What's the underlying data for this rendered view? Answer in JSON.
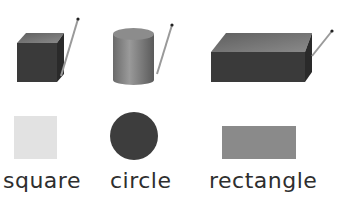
{
  "labels": {
    "square": "square",
    "circle": "circle",
    "rectangle": "rectangle"
  },
  "solids": [
    {
      "name": "cube",
      "flat_shape": "square"
    },
    {
      "name": "cylinder",
      "flat_shape": "circle"
    },
    {
      "name": "rectangular-prism",
      "flat_shape": "rectangle"
    }
  ],
  "colors": {
    "solid_front": "#3a3a3a",
    "solid_top": "#707070",
    "solid_side": "#2a2a2a",
    "square_fill": "#e2e2e2",
    "circle_fill": "#3d3d3d",
    "rectangle_fill": "#8a8a8a",
    "pencil": "#9a9a9a"
  }
}
